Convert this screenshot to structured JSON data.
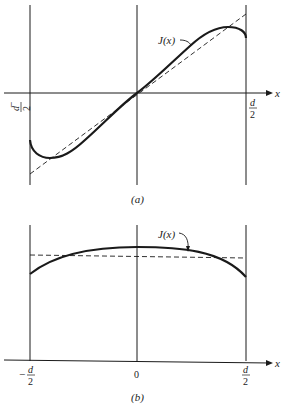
{
  "figure": {
    "panel_a": {
      "caption": "(a)",
      "curve_label": "J(x)",
      "x_axis_label": "x",
      "left_tick_minus": "−",
      "left_tick_num": "d",
      "left_tick_den": "2",
      "right_tick_num": "d",
      "right_tick_den": "2",
      "description": "Odd-symmetric current density J(x) across slab from -d/2 to d/2, with dashed linear reference"
    },
    "panel_b": {
      "caption": "(b)",
      "curve_label": "J(x)",
      "x_axis_label": "x",
      "left_tick_minus": "−",
      "left_tick_num": "d",
      "left_tick_den": "2",
      "center_tick": "0",
      "right_tick_num": "d",
      "right_tick_den": "2",
      "description": "Even-symmetric J(x) peaked at center, with dashed horizontal average line"
    },
    "colors": {
      "ink": "#1a1a1a",
      "background": "#ffffff"
    }
  }
}
